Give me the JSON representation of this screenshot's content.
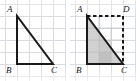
{
  "figure": {
    "background_color": "#ffffff",
    "grid": {
      "visible": true,
      "line_color": "#d7dade",
      "cell_size_px": 12,
      "columns": 5,
      "rows": 6
    },
    "stroke_color": "#1a1a1a",
    "shade_color": "#c9c9c9",
    "shade_color_dark": "#b0b0b0",
    "dash_color": "#1a1a1a"
  },
  "panels": [
    {
      "id": "left",
      "name": "triangle-only",
      "caption": "",
      "labels": [
        {
          "key": "A",
          "text": "A",
          "position": "top-left"
        },
        {
          "key": "B",
          "text": "B",
          "position": "bottom-left"
        },
        {
          "key": "C",
          "text": "C",
          "position": "bottom-right"
        }
      ],
      "shapes": {
        "triangle": {
          "type": "right-triangle",
          "vertices": {
            "A": [
              17,
              16
            ],
            "B": [
              17,
              64
            ],
            "C": [
              53,
              64
            ]
          },
          "filled": false,
          "stroke_width": 2
        }
      }
    },
    {
      "id": "right",
      "name": "triangle-with-completed-rectangle",
      "caption": "",
      "labels": [
        {
          "key": "A",
          "text": "A",
          "position": "top-left"
        },
        {
          "key": "B",
          "text": "B",
          "position": "bottom-left"
        },
        {
          "key": "C",
          "text": "C",
          "position": "bottom-right"
        },
        {
          "key": "D",
          "text": "D",
          "position": "top-right"
        }
      ],
      "shapes": {
        "triangle": {
          "type": "right-triangle",
          "vertices": {
            "A": [
              17,
              16
            ],
            "B": [
              17,
              64
            ],
            "C": [
              53,
              64
            ]
          },
          "filled": true,
          "fill": "#c9c9c9",
          "stroke_width": 2
        },
        "rectangle": {
          "type": "dashed-completion",
          "vertices": {
            "A": [
              17,
              16
            ],
            "D": [
              53,
              16
            ],
            "C": [
              53,
              64
            ],
            "B": [
              17,
              64
            ]
          },
          "dashed_edges": [
            "A-D",
            "D-C"
          ],
          "stroke_width": 2
        }
      }
    }
  ]
}
